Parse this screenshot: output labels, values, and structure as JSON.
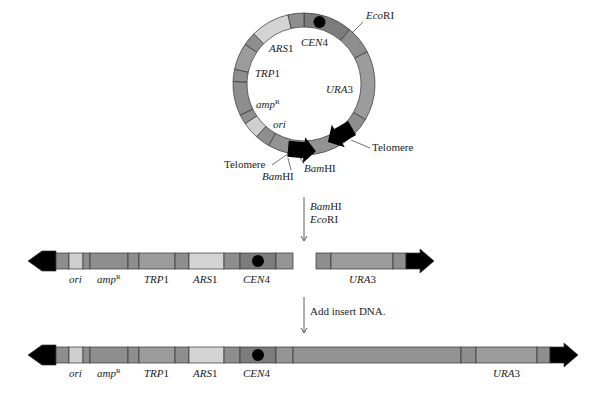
{
  "figure": {
    "colors": {
      "mid_gray": "#8e8e8e",
      "dark_gray": "#7c7c7c",
      "light_gray": "#cfcfcf",
      "pale_gray": "#a9a9a9",
      "telomere": "#000000",
      "outline": "#333333"
    }
  },
  "plasmid": {
    "labels": {
      "ecori": {
        "italic": "Eco",
        "roman": "RI"
      },
      "cen4": {
        "italic": "CEN",
        "roman": "4"
      },
      "ars1": {
        "italic": "ARS",
        "roman": "1"
      },
      "trp1": {
        "italic": "TRP",
        "roman": "1"
      },
      "ura3": {
        "italic": "URA",
        "roman": "3"
      },
      "ampr": {
        "italic": "amp",
        "sup": "R"
      },
      "ori": {
        "italic": "ori"
      },
      "telomere_right": "Telomere",
      "telomere_left": "Telomere",
      "bamhi_1": {
        "italic": "Bam",
        "roman": "HI"
      },
      "bamhi_2": {
        "italic": "Bam",
        "roman": "HI"
      }
    }
  },
  "step1": {
    "enzymes": [
      {
        "italic": "Bam",
        "roman": "HI"
      },
      {
        "italic": "Eco",
        "roman": "RI"
      }
    ]
  },
  "linear_fragments": {
    "left_arm": [
      "ori",
      "ampR",
      "TRP1",
      "ARS1",
      "CEN4"
    ],
    "right_arm": [
      "URA3"
    ],
    "labels": {
      "ori": {
        "italic": "ori"
      },
      "ampr": {
        "italic": "amp",
        "sup": "R"
      },
      "trp1": {
        "italic": "TRP",
        "roman": "1"
      },
      "ars1": {
        "italic": "ARS",
        "roman": "1"
      },
      "cen4": {
        "italic": "CEN",
        "roman": "4"
      },
      "ura3": {
        "italic": "URA",
        "roman": "3"
      }
    }
  },
  "step2": {
    "label": "Add insert DNA."
  },
  "final_yac": {
    "segments": [
      "telomere",
      "ori",
      "ampR",
      "TRP1",
      "ARS1",
      "CEN4",
      "insert DNA",
      "URA3",
      "telomere"
    ],
    "labels": {
      "ori": {
        "italic": "ori"
      },
      "ampr": {
        "italic": "amp",
        "sup": "R"
      },
      "trp1": {
        "italic": "TRP",
        "roman": "1"
      },
      "ars1": {
        "italic": "ARS",
        "roman": "1"
      },
      "cen4": {
        "italic": "CEN",
        "roman": "4"
      },
      "ura3": {
        "italic": "URA",
        "roman": "3"
      }
    }
  }
}
